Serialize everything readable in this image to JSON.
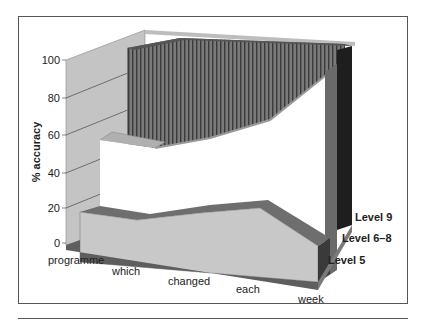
{
  "chart_data": {
    "type": "area",
    "subtype": "3d-area",
    "title": "",
    "xlabel": "",
    "ylabel": "% accuracy",
    "ylim": [
      0,
      100
    ],
    "yticks": [
      0,
      20,
      40,
      60,
      80,
      100
    ],
    "categories": [
      "programme",
      "which",
      "changed",
      "each",
      "week"
    ],
    "series": [
      {
        "name": "Level 5",
        "values": [
          14,
          10,
          14,
          17,
          5
        ]
      },
      {
        "name": "Level 6–8",
        "values": [
          57,
          55,
          60,
          70,
          90
        ]
      },
      {
        "name": "Level 9",
        "values": [
          98,
          99,
          99,
          99,
          99
        ]
      }
    ],
    "grid": true,
    "legend_position": "depth-axis labels (right)"
  },
  "axis": {
    "ylabel": "% accuracy",
    "yticks": [
      "0",
      "20",
      "40",
      "60",
      "80",
      "100"
    ],
    "categories": [
      "programme",
      "which",
      "changed",
      "each",
      "week"
    ],
    "series_labels": [
      "Level 9",
      "Level 6–8",
      "Level 5"
    ]
  },
  "colors": {
    "wall": "#c4c4c4",
    "level9_face": "#707070",
    "level9_stripe": "#3a3a3a",
    "level68_face": "#ffffff",
    "level68_top": "#b0b0b0",
    "level5_face": "#c8c8c8",
    "level5_top": "#6e6e6e",
    "floor": "#5e5e5e"
  }
}
